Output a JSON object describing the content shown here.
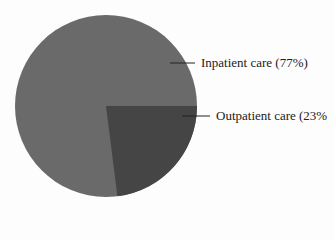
{
  "chart_data": {
    "type": "pie",
    "title": "",
    "categories": [
      "Inpatient care",
      "Outpatient care"
    ],
    "values": [
      77,
      23
    ],
    "labels": [
      "Inpatient care (77%)",
      "Outpatient care (23%"
    ],
    "colors": [
      "#6a6a6a",
      "#454545"
    ],
    "legend": "none (leader-line labels on right)"
  }
}
